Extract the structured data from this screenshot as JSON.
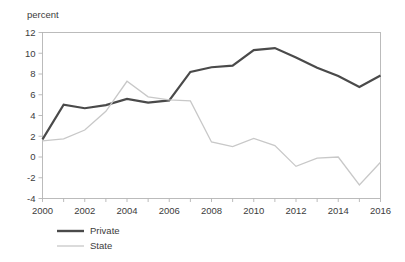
{
  "chart_data": {
    "type": "line",
    "title": "",
    "subtitle": "",
    "xlabel": "",
    "ylabel": "percent",
    "unit_label": "percent",
    "grid": false,
    "legend_position": "bottom-left",
    "x": [
      2000,
      2001,
      2002,
      2003,
      2004,
      2005,
      2006,
      2007,
      2008,
      2009,
      2010,
      2011,
      2012,
      2013,
      2014,
      2015,
      2016
    ],
    "xlim": [
      2000,
      2016
    ],
    "ylim": [
      -4,
      12
    ],
    "x_tick_labels": [
      "2000",
      "2002",
      "2004",
      "2006",
      "2008",
      "2010",
      "2012",
      "2014",
      "2016"
    ],
    "x_tick_values": [
      2000,
      2002,
      2004,
      2006,
      2008,
      2010,
      2012,
      2014,
      2016
    ],
    "x_minor_tick_values": [
      2001,
      2003,
      2005,
      2007,
      2009,
      2011,
      2013,
      2015
    ],
    "y_tick_labels": [
      "12",
      "10",
      "8",
      "6",
      "4",
      "2",
      "0",
      "-2",
      "-4"
    ],
    "y_tick_values": [
      12,
      10,
      8,
      6,
      4,
      2,
      0,
      -2,
      -4
    ],
    "series": [
      {
        "name": "Private",
        "color": "#4a4a4a",
        "width": 2.2,
        "values": [
          1.7,
          5.05,
          4.7,
          5.0,
          5.6,
          5.25,
          5.45,
          8.2,
          8.65,
          8.8,
          10.3,
          10.5,
          9.6,
          8.6,
          7.8,
          6.75,
          7.85
        ]
      },
      {
        "name": "State",
        "color": "#c8c8c8",
        "width": 1.3,
        "values": [
          1.55,
          1.75,
          2.6,
          4.4,
          7.3,
          5.8,
          5.5,
          5.4,
          1.45,
          1.0,
          1.8,
          1.1,
          -0.9,
          -0.1,
          0.0,
          -2.7,
          -0.5
        ]
      }
    ]
  },
  "legend": {
    "items": [
      {
        "label": "Private",
        "color": "#4a4a4a",
        "width": 2.4
      },
      {
        "label": "State",
        "color": "#c8c8c8",
        "width": 1.3
      }
    ]
  }
}
